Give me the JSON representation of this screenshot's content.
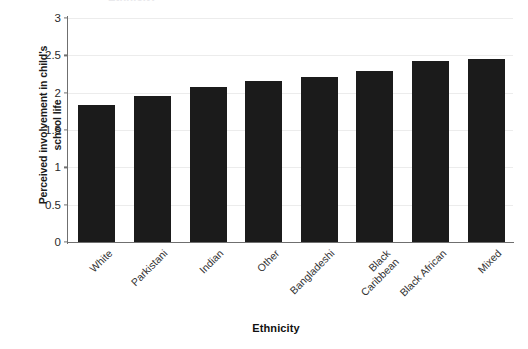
{
  "chart_data": {
    "type": "bar",
    "title": "",
    "xlabel": "Ethnicity",
    "ylabel": "Perceived involvement in child's school life",
    "ylabel_line1": "Perceived involvement in child's",
    "ylabel_line2": "school life",
    "categories": [
      "White",
      "Parkistani",
      "Indian",
      "Other",
      "Bangladeshi",
      "Black Caribbean",
      "Black African",
      "Mixed"
    ],
    "category_lines": [
      [
        "White"
      ],
      [
        "Parkistani"
      ],
      [
        "Indian"
      ],
      [
        "Other"
      ],
      [
        "Bangladeshi"
      ],
      [
        "Black",
        "Caribbean"
      ],
      [
        "Black African"
      ],
      [
        "Mixed"
      ]
    ],
    "values": [
      1.84,
      1.96,
      2.07,
      2.16,
      2.21,
      2.29,
      2.43,
      2.45
    ],
    "ylim": [
      0,
      3
    ],
    "yticks": [
      0,
      0.5,
      1,
      1.5,
      2,
      2.5,
      3
    ],
    "ytick_labels": [
      "0",
      "0.5",
      "1",
      "1.5",
      "2",
      "2.5",
      "3"
    ],
    "grid": true,
    "grid_axis": "y",
    "legend": "none",
    "bar_color": "#1b1b1b",
    "grid_color": "#ececec",
    "axis_color": "#6f6f6f"
  },
  "figure": {
    "background": "#ffffff",
    "top_remnant": "Ethnicity",
    "top_remnant_2": "involvement"
  }
}
